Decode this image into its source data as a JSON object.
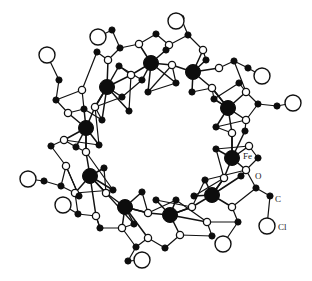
{
  "figure": {
    "kind": "molecular-structure-diagram",
    "background_color": "#ffffff",
    "line_color": "#111111",
    "width": 312,
    "height": 281
  },
  "legend_labels": [
    {
      "id": "label-fe",
      "text": "Fe",
      "x": 243,
      "y": 157
    },
    {
      "id": "label-o",
      "text": "O",
      "x": 255,
      "y": 177
    },
    {
      "id": "label-c",
      "text": "C",
      "x": 275,
      "y": 200
    },
    {
      "id": "label-cl",
      "text": "Cl",
      "x": 278,
      "y": 228
    }
  ],
  "atom_styles": {
    "Fe": {
      "element": "Fe",
      "radius": 7.5,
      "fill": "#0d0d0d",
      "stroke": "#0d0d0d",
      "stroke_width": 1
    },
    "O": {
      "element": "O",
      "radius": 3.6,
      "fill": "#ffffff",
      "stroke": "#111111",
      "stroke_width": 1.3
    },
    "C": {
      "element": "C",
      "radius": 3.1,
      "fill": "#0d0d0d",
      "stroke": "#0d0d0d",
      "stroke_width": 1
    },
    "Cl": {
      "element": "Cl",
      "radius": 8.0,
      "fill": "#ffffff",
      "stroke": "#111111",
      "stroke_width": 1.4
    }
  },
  "atoms": [
    {
      "i": 0,
      "e": "Fe",
      "x": 107,
      "y": 87
    },
    {
      "i": 1,
      "e": "Fe",
      "x": 151,
      "y": 63
    },
    {
      "i": 2,
      "e": "Fe",
      "x": 193,
      "y": 72
    },
    {
      "i": 3,
      "e": "Fe",
      "x": 228,
      "y": 108
    },
    {
      "i": 4,
      "e": "Fe",
      "x": 232,
      "y": 158
    },
    {
      "i": 5,
      "e": "Fe",
      "x": 212,
      "y": 195
    },
    {
      "i": 6,
      "e": "Fe",
      "x": 170,
      "y": 215
    },
    {
      "i": 7,
      "e": "Fe",
      "x": 125,
      "y": 207
    },
    {
      "i": 8,
      "e": "Fe",
      "x": 90,
      "y": 176
    },
    {
      "i": 9,
      "e": "Fe",
      "x": 86,
      "y": 128
    },
    {
      "i": 10,
      "e": "O",
      "x": 131,
      "y": 75
    },
    {
      "i": 11,
      "e": "O",
      "x": 172,
      "y": 65
    },
    {
      "i": 12,
      "e": "O",
      "x": 212,
      "y": 88
    },
    {
      "i": 13,
      "e": "O",
      "x": 232,
      "y": 133
    },
    {
      "i": 14,
      "e": "O",
      "x": 224,
      "y": 178
    },
    {
      "i": 15,
      "e": "O",
      "x": 192,
      "y": 207
    },
    {
      "i": 16,
      "e": "O",
      "x": 148,
      "y": 213
    },
    {
      "i": 17,
      "e": "O",
      "x": 106,
      "y": 193
    },
    {
      "i": 18,
      "e": "O",
      "x": 86,
      "y": 152
    },
    {
      "i": 19,
      "e": "O",
      "x": 95,
      "y": 107
    },
    {
      "i": 20,
      "e": "O",
      "x": 108,
      "y": 60
    },
    {
      "i": 21,
      "e": "O",
      "x": 139,
      "y": 44
    },
    {
      "i": 22,
      "e": "O",
      "x": 169,
      "y": 45
    },
    {
      "i": 23,
      "e": "O",
      "x": 203,
      "y": 50
    },
    {
      "i": 24,
      "e": "O",
      "x": 219,
      "y": 68
    },
    {
      "i": 25,
      "e": "O",
      "x": 246,
      "y": 92
    },
    {
      "i": 26,
      "e": "O",
      "x": 246,
      "y": 120
    },
    {
      "i": 27,
      "e": "O",
      "x": 249,
      "y": 146
    },
    {
      "i": 28,
      "e": "O",
      "x": 246,
      "y": 170
    },
    {
      "i": 29,
      "e": "O",
      "x": 232,
      "y": 207
    },
    {
      "i": 30,
      "e": "O",
      "x": 207,
      "y": 222
    },
    {
      "i": 31,
      "e": "O",
      "x": 180,
      "y": 235
    },
    {
      "i": 32,
      "e": "O",
      "x": 148,
      "y": 238
    },
    {
      "i": 33,
      "e": "O",
      "x": 122,
      "y": 228
    },
    {
      "i": 34,
      "e": "O",
      "x": 96,
      "y": 216
    },
    {
      "i": 35,
      "e": "O",
      "x": 75,
      "y": 193
    },
    {
      "i": 36,
      "e": "O",
      "x": 66,
      "y": 166
    },
    {
      "i": 37,
      "e": "O",
      "x": 64,
      "y": 140
    },
    {
      "i": 38,
      "e": "O",
      "x": 68,
      "y": 113
    },
    {
      "i": 39,
      "e": "O",
      "x": 82,
      "y": 90
    },
    {
      "i": 40,
      "e": "C",
      "x": 120,
      "y": 48
    },
    {
      "i": 41,
      "e": "C",
      "x": 112,
      "y": 30
    },
    {
      "i": 42,
      "e": "C",
      "x": 156,
      "y": 34
    },
    {
      "i": 43,
      "e": "C",
      "x": 188,
      "y": 35
    },
    {
      "i": 44,
      "e": "C",
      "x": 181,
      "y": 18
    },
    {
      "i": 45,
      "e": "C",
      "x": 234,
      "y": 61
    },
    {
      "i": 46,
      "e": "C",
      "x": 248,
      "y": 68
    },
    {
      "i": 47,
      "e": "C",
      "x": 258,
      "y": 104
    },
    {
      "i": 48,
      "e": "C",
      "x": 277,
      "y": 106
    },
    {
      "i": 49,
      "e": "C",
      "x": 258,
      "y": 158
    },
    {
      "i": 50,
      "e": "C",
      "x": 256,
      "y": 188
    },
    {
      "i": 51,
      "e": "C",
      "x": 270,
      "y": 196
    },
    {
      "i": 52,
      "e": "C",
      "x": 238,
      "y": 222
    },
    {
      "i": 53,
      "e": "C",
      "x": 212,
      "y": 236
    },
    {
      "i": 54,
      "e": "C",
      "x": 165,
      "y": 248
    },
    {
      "i": 55,
      "e": "C",
      "x": 136,
      "y": 247
    },
    {
      "i": 56,
      "e": "C",
      "x": 128,
      "y": 261
    },
    {
      "i": 57,
      "e": "C",
      "x": 100,
      "y": 228
    },
    {
      "i": 58,
      "e": "C",
      "x": 78,
      "y": 214
    },
    {
      "i": 59,
      "e": "C",
      "x": 61,
      "y": 186
    },
    {
      "i": 60,
      "e": "C",
      "x": 44,
      "y": 181
    },
    {
      "i": 61,
      "e": "C",
      "x": 51,
      "y": 146
    },
    {
      "i": 62,
      "e": "C",
      "x": 56,
      "y": 100
    },
    {
      "i": 63,
      "e": "C",
      "x": 59,
      "y": 80
    },
    {
      "i": 64,
      "e": "C",
      "x": 97,
      "y": 52
    },
    {
      "i": 65,
      "e": "C",
      "x": 122,
      "y": 97
    },
    {
      "i": 66,
      "e": "C",
      "x": 142,
      "y": 80
    },
    {
      "i": 67,
      "e": "C",
      "x": 119,
      "y": 66
    },
    {
      "i": 68,
      "e": "C",
      "x": 166,
      "y": 50
    },
    {
      "i": 69,
      "e": "C",
      "x": 176,
      "y": 83
    },
    {
      "i": 70,
      "e": "C",
      "x": 206,
      "y": 60
    },
    {
      "i": 71,
      "e": "C",
      "x": 214,
      "y": 99
    },
    {
      "i": 72,
      "e": "C",
      "x": 239,
      "y": 83
    },
    {
      "i": 73,
      "e": "C",
      "x": 216,
      "y": 127
    },
    {
      "i": 74,
      "e": "C",
      "x": 245,
      "y": 131
    },
    {
      "i": 75,
      "e": "C",
      "x": 216,
      "y": 149
    },
    {
      "i": 76,
      "e": "C",
      "x": 241,
      "y": 176
    },
    {
      "i": 77,
      "e": "C",
      "x": 205,
      "y": 180
    },
    {
      "i": 78,
      "e": "C",
      "x": 194,
      "y": 196
    },
    {
      "i": 79,
      "e": "C",
      "x": 176,
      "y": 200
    },
    {
      "i": 80,
      "e": "C",
      "x": 156,
      "y": 200
    },
    {
      "i": 81,
      "e": "C",
      "x": 134,
      "y": 224
    },
    {
      "i": 82,
      "e": "C",
      "x": 142,
      "y": 192
    },
    {
      "i": 83,
      "e": "C",
      "x": 113,
      "y": 190
    },
    {
      "i": 84,
      "e": "C",
      "x": 104,
      "y": 168
    },
    {
      "i": 85,
      "e": "C",
      "x": 79,
      "y": 196
    },
    {
      "i": 86,
      "e": "C",
      "x": 76,
      "y": 147
    },
    {
      "i": 87,
      "e": "C",
      "x": 99,
      "y": 145
    },
    {
      "i": 88,
      "e": "C",
      "x": 102,
      "y": 120
    },
    {
      "i": 89,
      "e": "C",
      "x": 84,
      "y": 109
    },
    {
      "i": 90,
      "e": "C",
      "x": 129,
      "y": 111
    },
    {
      "i": 91,
      "e": "C",
      "x": 148,
      "y": 92
    },
    {
      "i": 92,
      "e": "C",
      "x": 192,
      "y": 92
    },
    {
      "i": 93,
      "e": "Cl",
      "x": 98,
      "y": 37
    },
    {
      "i": 94,
      "e": "Cl",
      "x": 47,
      "y": 55
    },
    {
      "i": 95,
      "e": "Cl",
      "x": 176,
      "y": 21
    },
    {
      "i": 96,
      "e": "Cl",
      "x": 262,
      "y": 76
    },
    {
      "i": 97,
      "e": "Cl",
      "x": 293,
      "y": 103
    },
    {
      "i": 98,
      "e": "Cl",
      "x": 267,
      "y": 226
    },
    {
      "i": 99,
      "e": "Cl",
      "x": 223,
      "y": 244
    },
    {
      "i": 100,
      "e": "Cl",
      "x": 142,
      "y": 260
    },
    {
      "i": 101,
      "e": "Cl",
      "x": 63,
      "y": 205
    },
    {
      "i": 102,
      "e": "Cl",
      "x": 28,
      "y": 179
    }
  ],
  "bonds": [
    [
      0,
      10
    ],
    [
      10,
      1
    ],
    [
      1,
      11
    ],
    [
      11,
      2
    ],
    [
      2,
      12
    ],
    [
      12,
      3
    ],
    [
      3,
      13
    ],
    [
      13,
      4
    ],
    [
      4,
      14
    ],
    [
      14,
      5
    ],
    [
      5,
      15
    ],
    [
      15,
      6
    ],
    [
      6,
      16
    ],
    [
      16,
      7
    ],
    [
      7,
      17
    ],
    [
      17,
      8
    ],
    [
      8,
      18
    ],
    [
      18,
      9
    ],
    [
      9,
      19
    ],
    [
      19,
      0
    ],
    [
      0,
      20
    ],
    [
      0,
      65
    ],
    [
      0,
      90
    ],
    [
      0,
      88
    ],
    [
      0,
      19
    ],
    [
      0,
      67
    ],
    [
      1,
      21
    ],
    [
      1,
      66
    ],
    [
      1,
      68
    ],
    [
      1,
      91
    ],
    [
      1,
      69
    ],
    [
      2,
      23
    ],
    [
      2,
      70
    ],
    [
      2,
      92
    ],
    [
      2,
      24
    ],
    [
      3,
      25
    ],
    [
      3,
      26
    ],
    [
      3,
      71
    ],
    [
      3,
      73
    ],
    [
      3,
      12
    ],
    [
      4,
      27
    ],
    [
      4,
      28
    ],
    [
      4,
      74
    ],
    [
      4,
      75
    ],
    [
      4,
      13
    ],
    [
      5,
      29
    ],
    [
      5,
      76
    ],
    [
      5,
      77
    ],
    [
      5,
      14
    ],
    [
      5,
      78
    ],
    [
      6,
      31
    ],
    [
      6,
      30
    ],
    [
      6,
      79
    ],
    [
      6,
      80
    ],
    [
      6,
      15
    ],
    [
      7,
      33
    ],
    [
      7,
      32
    ],
    [
      7,
      81
    ],
    [
      7,
      82
    ],
    [
      7,
      16
    ],
    [
      8,
      35
    ],
    [
      8,
      34
    ],
    [
      8,
      83
    ],
    [
      8,
      84
    ],
    [
      8,
      17
    ],
    [
      9,
      37
    ],
    [
      9,
      38
    ],
    [
      9,
      86
    ],
    [
      9,
      87
    ],
    [
      9,
      18
    ],
    [
      9,
      89
    ],
    [
      20,
      40
    ],
    [
      40,
      21
    ],
    [
      40,
      41
    ],
    [
      41,
      93
    ],
    [
      21,
      42
    ],
    [
      42,
      22
    ],
    [
      22,
      68
    ],
    [
      22,
      43
    ],
    [
      43,
      23
    ],
    [
      43,
      44
    ],
    [
      44,
      95
    ],
    [
      23,
      70
    ],
    [
      24,
      45
    ],
    [
      45,
      25
    ],
    [
      45,
      46
    ],
    [
      46,
      96
    ],
    [
      25,
      47
    ],
    [
      47,
      26
    ],
    [
      47,
      48
    ],
    [
      48,
      97
    ],
    [
      26,
      74
    ],
    [
      27,
      49
    ],
    [
      49,
      28
    ],
    [
      28,
      50
    ],
    [
      50,
      29
    ],
    [
      50,
      51
    ],
    [
      51,
      98
    ],
    [
      29,
      52
    ],
    [
      52,
      30
    ],
    [
      52,
      99
    ],
    [
      30,
      53
    ],
    [
      53,
      31
    ],
    [
      31,
      54
    ],
    [
      54,
      32
    ],
    [
      32,
      55
    ],
    [
      55,
      33
    ],
    [
      55,
      56
    ],
    [
      56,
      100
    ],
    [
      33,
      57
    ],
    [
      57,
      34
    ],
    [
      34,
      58
    ],
    [
      58,
      35
    ],
    [
      58,
      101
    ],
    [
      35,
      59
    ],
    [
      59,
      36
    ],
    [
      59,
      60
    ],
    [
      60,
      102
    ],
    [
      36,
      61
    ],
    [
      61,
      37
    ],
    [
      37,
      86
    ],
    [
      38,
      62
    ],
    [
      62,
      39
    ],
    [
      62,
      63
    ],
    [
      63,
      94
    ],
    [
      39,
      64
    ],
    [
      64,
      20
    ],
    [
      65,
      66
    ],
    [
      66,
      67
    ],
    [
      67,
      10
    ],
    [
      65,
      19
    ],
    [
      69,
      11
    ],
    [
      69,
      91
    ],
    [
      71,
      12
    ],
    [
      71,
      72
    ],
    [
      72,
      25
    ],
    [
      73,
      13
    ],
    [
      73,
      26
    ],
    [
      75,
      14
    ],
    [
      75,
      27
    ],
    [
      77,
      15
    ],
    [
      77,
      28
    ],
    [
      79,
      16
    ],
    [
      79,
      30
    ],
    [
      81,
      17
    ],
    [
      81,
      33
    ],
    [
      83,
      18
    ],
    [
      83,
      35
    ],
    [
      87,
      19
    ],
    [
      87,
      37
    ],
    [
      88,
      19
    ],
    [
      88,
      89
    ],
    [
      89,
      38
    ],
    [
      90,
      10
    ],
    [
      91,
      11
    ],
    [
      92,
      12
    ],
    [
      84,
      17
    ],
    [
      85,
      35
    ],
    [
      85,
      36
    ],
    [
      86,
      18
    ],
    [
      80,
      15
    ],
    [
      82,
      16
    ],
    [
      78,
      14
    ],
    [
      76,
      28
    ],
    [
      36,
      85
    ],
    [
      34,
      57
    ],
    [
      39,
      89
    ]
  ],
  "counts": {
    "fe_atoms": 10,
    "cl_atoms": 10,
    "bridging_oxygens": 30
  }
}
